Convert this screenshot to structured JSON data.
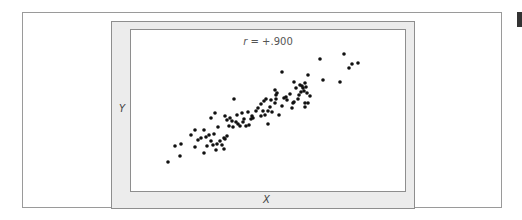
{
  "chart_data": {
    "type": "scatter",
    "title": "",
    "annotation": "r = +.900",
    "annotation_parts": {
      "symbol": "r",
      "rest": " = +.900"
    },
    "xlabel": "X",
    "ylabel": "Y",
    "grid": false,
    "legend": null,
    "correlation": 0.9,
    "point_color": "#111111",
    "point_radius": 1.8,
    "points_px": [
      [
        168,
        162
      ],
      [
        175,
        146
      ],
      [
        180,
        156
      ],
      [
        181,
        144
      ],
      [
        191,
        135
      ],
      [
        195,
        130
      ],
      [
        195,
        147
      ],
      [
        204,
        153
      ],
      [
        204,
        130
      ],
      [
        206,
        137
      ],
      [
        209,
        135
      ],
      [
        211,
        141
      ],
      [
        214,
        134
      ],
      [
        216,
        150
      ],
      [
        213,
        145
      ],
      [
        217,
        144
      ],
      [
        220,
        141
      ],
      [
        222,
        145
      ],
      [
        224,
        149
      ],
      [
        224,
        138
      ],
      [
        227,
        136
      ],
      [
        211,
        118
      ],
      [
        215,
        113
      ],
      [
        225,
        139
      ],
      [
        234,
        99
      ],
      [
        225,
        116
      ],
      [
        227,
        120
      ],
      [
        230,
        118
      ],
      [
        232,
        121
      ],
      [
        233,
        127
      ],
      [
        236,
        122
      ],
      [
        237,
        115
      ],
      [
        238,
        124
      ],
      [
        240,
        126
      ],
      [
        242,
        113
      ],
      [
        244,
        119
      ],
      [
        246,
        126
      ],
      [
        249,
        125
      ],
      [
        251,
        119
      ],
      [
        248,
        112
      ],
      [
        252,
        116
      ],
      [
        256,
        111
      ],
      [
        258,
        108
      ],
      [
        261,
        116
      ],
      [
        265,
        115
      ],
      [
        268,
        124
      ],
      [
        261,
        104
      ],
      [
        264,
        101
      ],
      [
        266,
        99
      ],
      [
        270,
        107
      ],
      [
        272,
        112
      ],
      [
        275,
        103
      ],
      [
        276,
        95
      ],
      [
        277,
        93
      ],
      [
        275,
        90
      ],
      [
        282,
        106
      ],
      [
        284,
        98
      ],
      [
        286,
        97
      ],
      [
        290,
        94
      ],
      [
        293,
        103
      ],
      [
        294,
        102
      ],
      [
        299,
        95
      ],
      [
        301,
        92
      ],
      [
        292,
        108
      ],
      [
        305,
        107
      ],
      [
        279,
        115
      ],
      [
        282,
        72
      ],
      [
        294,
        82
      ],
      [
        296,
        88
      ],
      [
        300,
        85
      ],
      [
        302,
        86
      ],
      [
        304,
        91
      ],
      [
        305,
        83
      ],
      [
        306,
        87
      ],
      [
        307,
        93
      ],
      [
        308,
        103
      ],
      [
        308,
        75
      ],
      [
        310,
        96
      ],
      [
        305,
        103
      ],
      [
        320,
        59
      ],
      [
        323,
        80
      ],
      [
        340,
        82
      ],
      [
        344,
        54
      ],
      [
        349,
        68
      ],
      [
        352,
        64
      ],
      [
        358,
        63
      ],
      [
        263,
        111
      ],
      [
        276,
        99
      ],
      [
        268,
        111
      ],
      [
        198,
        140
      ],
      [
        201,
        138
      ],
      [
        207,
        146
      ],
      [
        218,
        127
      ],
      [
        229,
        126
      ],
      [
        243,
        122
      ],
      [
        253,
        118
      ],
      [
        271,
        100
      ],
      [
        287,
        100
      ],
      [
        298,
        99
      ],
      [
        303,
        88
      ]
    ]
  },
  "labels": {
    "r_symbol": "r",
    "r_value": " = +.900",
    "x_axis": "X",
    "y_axis": "Y"
  }
}
